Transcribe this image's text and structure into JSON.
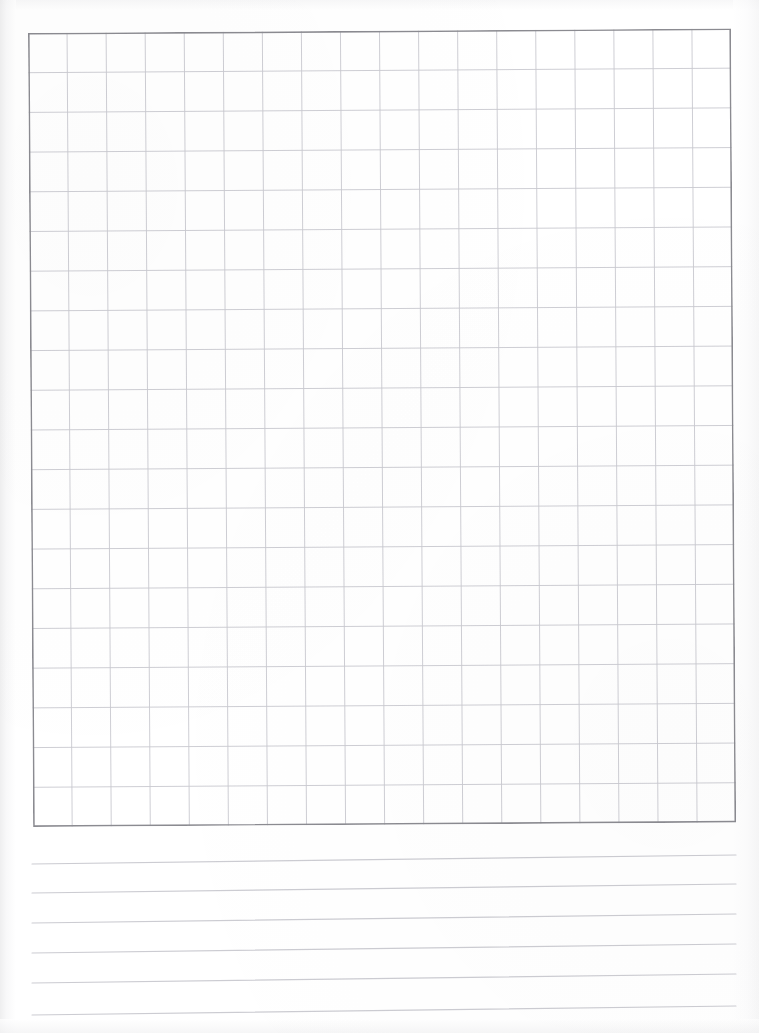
{
  "page": {
    "kind": "scanned-worksheet",
    "width": 759,
    "height": 1033,
    "background_color": "#ffffff",
    "orientation": "portrait"
  },
  "grid": {
    "label": "graph-paper-grid",
    "columns": 18,
    "rows": 20,
    "left": 28,
    "top": 33,
    "width": 703,
    "height": 794,
    "cell_width": 39.05,
    "cell_height": 39.7,
    "rotation_degrees": -0.37,
    "border_color": "#8b8b91",
    "border_width": 1.6,
    "line_color": "#c9c9cf",
    "line_width": 0.9
  },
  "ruled_lines": {
    "label": "writing-lines",
    "count": 6,
    "left": 32,
    "right": 736,
    "color": "#ccccd2",
    "line_width": 1.1,
    "spacing": 30,
    "left_y": [
      864,
      893,
      923,
      953,
      983,
      1015
    ],
    "right_y": [
      855,
      884,
      914,
      944,
      974,
      1006
    ]
  },
  "chart_data": {
    "type": "table",
    "title": "",
    "subtitle": "",
    "xlabel": "",
    "ylabel": "",
    "grid": true,
    "legend": "none",
    "categories": [],
    "values": [],
    "annotations": [],
    "note": "Blank scanned worksheet: empty 18x20 graph-paper grid above 6 blank ruled writing lines. No data plotted, no tick labels, no legend."
  }
}
